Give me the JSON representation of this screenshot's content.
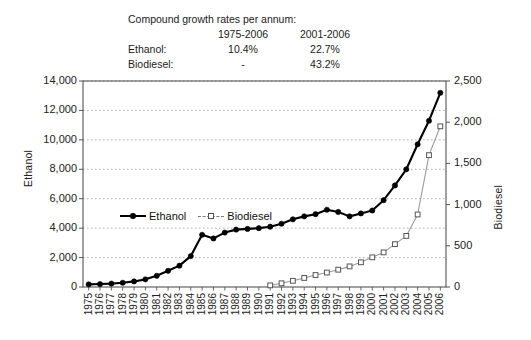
{
  "note": {
    "title": "Compound growth rates per annum:",
    "col1": "1975-2006",
    "col2": "2001-2006",
    "rows": [
      {
        "label": "Ethanol:",
        "v1": "10.4%",
        "v2": "22.7%"
      },
      {
        "label": "Biodiesel:",
        "v1": "-",
        "v2": "43.2%"
      }
    ]
  },
  "legend": {
    "ethanol": "Ethanol",
    "biodiesel": "Biodiesel"
  },
  "colors": {
    "ethanol": "#000000",
    "biodiesel": "#9a9a9a",
    "biodiesel_marker_edge": "#555555",
    "grid": "#a8a8a8",
    "axis": "#555555",
    "text": "#1a1a1a"
  },
  "chart_data": {
    "type": "line",
    "title": "",
    "subtitle": "",
    "xlabel": "",
    "ylabel": "Ethanol",
    "y2label": "Biodiesel",
    "ylim": [
      0,
      14000
    ],
    "y2lim": [
      0,
      2500
    ],
    "yticks": [
      "0",
      "2,000",
      "4,000",
      "6,000",
      "8,000",
      "10,000",
      "12,000",
      "14,000"
    ],
    "ytick_values": [
      0,
      2000,
      4000,
      6000,
      8000,
      10000,
      12000,
      14000
    ],
    "y2ticks": [
      "0",
      "500",
      "1,000",
      "1,500",
      "2,000",
      "2,500"
    ],
    "y2tick_values": [
      0,
      500,
      1000,
      1500,
      2000,
      2500
    ],
    "grid": true,
    "legend_position": "inside-upper-left",
    "categories": [
      "1975",
      "1976",
      "1977",
      "1978",
      "1979",
      "1980",
      "1981",
      "1982",
      "1983",
      "1984",
      "1985",
      "1986",
      "1987",
      "1988",
      "1989",
      "1990",
      "1991",
      "1992",
      "1993",
      "1994",
      "1995",
      "1996",
      "1997",
      "1998",
      "1999",
      "2000",
      "2001",
      "2002",
      "2003",
      "2004",
      "2005",
      "2006"
    ],
    "series": [
      {
        "name": "Ethanol",
        "axis": "left",
        "marker": "filled-circle",
        "line": "solid",
        "values": [
          180,
          200,
          230,
          290,
          380,
          520,
          760,
          1100,
          1450,
          2100,
          3550,
          3300,
          3700,
          3900,
          3950,
          4000,
          4100,
          4300,
          4600,
          4800,
          4950,
          5250,
          5100,
          4800,
          5000,
          5200,
          5900,
          6900,
          8000,
          9700,
          11300,
          13200
        ]
      },
      {
        "name": "Biodiesel",
        "axis": "right",
        "marker": "open-square",
        "line": "solid-thin",
        "values": [
          null,
          null,
          null,
          null,
          null,
          null,
          null,
          null,
          null,
          null,
          null,
          null,
          null,
          null,
          null,
          null,
          20,
          45,
          75,
          110,
          145,
          175,
          210,
          250,
          300,
          360,
          420,
          520,
          620,
          880,
          1600,
          1950
        ]
      }
    ]
  }
}
